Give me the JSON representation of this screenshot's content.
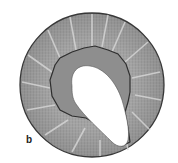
{
  "figure": {
    "panel_label": "b",
    "colors": {
      "background": "#ffffff",
      "outer_fill": "#9a9a9a",
      "inner_layer": "#8c8c8c",
      "outline": "#3a3a3a",
      "lumen": "#ffffff"
    }
  }
}
